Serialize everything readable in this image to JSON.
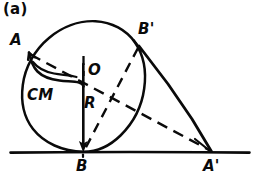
{
  "figure": {
    "panel_label": "(a)",
    "labels": {
      "panel": "(a)",
      "point_A": "A",
      "point_B_prime": "B'",
      "center_O": "O",
      "center_of_mass": "CM",
      "radius": "R",
      "point_B": "B",
      "point_A_prime": "A'"
    },
    "colors": {
      "ink": "#0a0a0a",
      "background": "#ffffff"
    },
    "geometry": {
      "ground_line": {
        "x1": 10,
        "y1": 152,
        "x2": 250,
        "y2": 152
      },
      "circle": {
        "cx": 84,
        "cy": 87,
        "r": 63
      },
      "center_point": {
        "x": 84,
        "y": 85
      },
      "points": {
        "A": {
          "x": 31,
          "y": 54
        },
        "B": {
          "x": 83,
          "y": 152
        },
        "A_prime": {
          "x": 212,
          "y": 152
        },
        "B_prime": {
          "x": 140,
          "y": 47
        }
      },
      "radius_arrow": {
        "x1": 83,
        "y1": 64,
        "x2": 83,
        "y2": 151
      },
      "solid_chord_B_prime_to_A_prime": {
        "from": "B'",
        "to": "A'"
      },
      "dashed_segment_A_to_A_prime": {
        "from": "A",
        "to": "A'"
      },
      "dashed_segment_B_prime_to_B": {
        "from": "B'",
        "to": "B"
      },
      "cm_marker_curve": "wavy hand-drawn connector from A to center"
    }
  }
}
